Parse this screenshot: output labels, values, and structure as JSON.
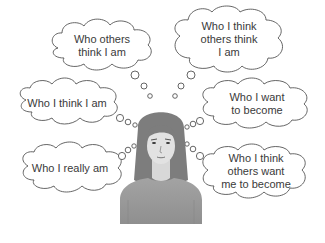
{
  "diagram": {
    "type": "thought-bubbles-around-person",
    "figure": "woman-portrait",
    "colors": {
      "bubble_stroke": "#555555",
      "bubble_fill": "#ffffff",
      "text": "#3a3a3a",
      "hair": "#7d7d7d",
      "skin": "#e2e2e2",
      "sweater": "#9a9a9a"
    },
    "bubbles": [
      {
        "id": "top-left",
        "lines": [
          "Who others",
          "think I am"
        ]
      },
      {
        "id": "top-right",
        "lines": [
          "Who I think",
          "others think",
          "I am"
        ]
      },
      {
        "id": "mid-left",
        "lines": [
          "Who I think I am"
        ]
      },
      {
        "id": "mid-right",
        "lines": [
          "Who I want",
          "to become"
        ]
      },
      {
        "id": "bottom-left",
        "lines": [
          "Who I really am"
        ]
      },
      {
        "id": "bottom-right",
        "lines": [
          "Who I think",
          "others want",
          "me to become"
        ]
      }
    ]
  }
}
